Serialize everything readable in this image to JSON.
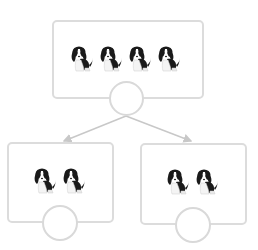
{
  "diagram": {
    "type": "tree-division",
    "top_cutoff_text": "",
    "colors": {
      "box_border": "#dcdcdc",
      "circle_border": "#d9d9d9",
      "arrow": "#c8c8c8",
      "dog_dark": "#1a1a1a",
      "dog_light": "#ffffff"
    },
    "parent": {
      "icon": "dog-icon",
      "count": 4,
      "answer_circle_value": ""
    },
    "children": [
      {
        "icon": "dog-icon",
        "count": 2,
        "answer_circle_value": ""
      },
      {
        "icon": "dog-icon",
        "count": 2,
        "answer_circle_value": ""
      }
    ]
  }
}
